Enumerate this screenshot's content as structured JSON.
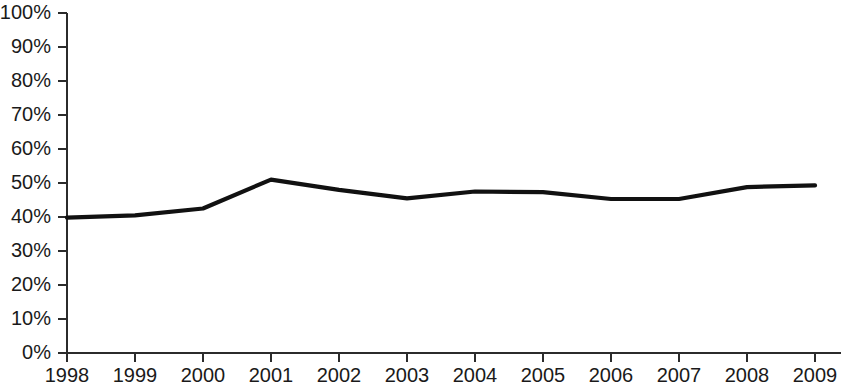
{
  "chart_data": {
    "type": "line",
    "title": "",
    "subtitle": "",
    "xlabel": "",
    "ylabel": "",
    "categories": [
      "1998",
      "1999",
      "2000",
      "2001",
      "2002",
      "2003",
      "2004",
      "2005",
      "2006",
      "2007",
      "2008",
      "2009"
    ],
    "x": [
      1998,
      1999,
      2000,
      2001,
      2002,
      2003,
      2004,
      2005,
      2006,
      2007,
      2008,
      2009
    ],
    "values": [
      39.8,
      40.5,
      42.5,
      51.0,
      48.0,
      45.5,
      47.5,
      47.3,
      45.3,
      45.3,
      48.8,
      49.3
    ],
    "series": [
      {
        "name": "",
        "values": [
          39.8,
          40.5,
          42.5,
          51.0,
          48.0,
          45.5,
          47.5,
          47.3,
          45.3,
          45.3,
          48.8,
          49.3
        ],
        "color": "#111111"
      }
    ],
    "ylim": [
      0,
      100
    ],
    "ytick_values": [
      0,
      10,
      20,
      30,
      40,
      50,
      60,
      70,
      80,
      90,
      100
    ],
    "ytick_labels": [
      "0%",
      "10%",
      "20%",
      "30%",
      "40%",
      "50%",
      "60%",
      "70%",
      "80%",
      "90%",
      "100%"
    ],
    "xtick_labels": [
      "1998",
      "1999",
      "2000",
      "2001",
      "2002",
      "2003",
      "2004",
      "2005",
      "2006",
      "2007",
      "2008",
      "2009"
    ],
    "grid": false,
    "legend": "none",
    "annotations": [],
    "axis_color": "#2b2b2b",
    "background_color": "#ffffff"
  }
}
